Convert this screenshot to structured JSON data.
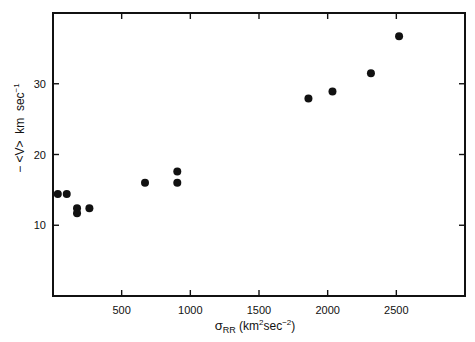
{
  "chart_data": {
    "type": "scatter",
    "title": "",
    "xlabel": "σRR (km²sec⁻²)",
    "xlabel_parts": {
      "symbol": "σ",
      "subscript": "RR",
      "unit_open": " (km",
      "unit_sup1": "2",
      "unit_mid": "sec",
      "unit_sup2": "−2",
      "unit_close": ")"
    },
    "ylabel": "− <V> km sec⁻¹",
    "ylabel_parts": {
      "main": "− <V>  km  sec",
      "sup": "−1"
    },
    "xlim": [
      0,
      3000
    ],
    "ylim": [
      0,
      40
    ],
    "xticks": [
      500,
      1000,
      1500,
      2000,
      2500
    ],
    "xtick_labels": [
      "500",
      "1000",
      "1500",
      "2000",
      "2500"
    ],
    "yticks": [
      10,
      20,
      30
    ],
    "ytick_labels": [
      "10",
      "20",
      "30"
    ],
    "grid": false,
    "legend": null,
    "series": [
      {
        "name": "data",
        "marker": "filled-circle",
        "color": "#111111",
        "points": [
          {
            "x": 35,
            "y": 14.4
          },
          {
            "x": 100,
            "y": 14.4
          },
          {
            "x": 175,
            "y": 12.4
          },
          {
            "x": 175,
            "y": 11.7
          },
          {
            "x": 265,
            "y": 12.4
          },
          {
            "x": 670,
            "y": 16.0
          },
          {
            "x": 905,
            "y": 17.6
          },
          {
            "x": 905,
            "y": 16.0
          },
          {
            "x": 1860,
            "y": 27.9
          },
          {
            "x": 2035,
            "y": 28.9
          },
          {
            "x": 2315,
            "y": 31.5
          },
          {
            "x": 2520,
            "y": 36.7
          }
        ]
      }
    ]
  }
}
